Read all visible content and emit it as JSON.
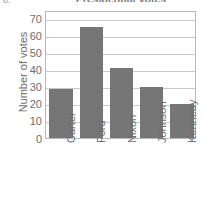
{
  "item_marker": "8.",
  "chart_data": {
    "type": "bar",
    "title": "Presidential Votes",
    "xlabel": "",
    "ylabel": "Number of votes",
    "categories": [
      "Carter",
      "Ford",
      "Nixon",
      "Johnson",
      "Kennedy"
    ],
    "values": [
      29,
      65,
      41,
      30,
      20
    ],
    "yticks": [
      0,
      10,
      20,
      30,
      40,
      50,
      60,
      70
    ],
    "ylim": [
      0,
      75
    ],
    "grid": true,
    "legend": "none",
    "bar_color": "#767676",
    "frame_color": "#b9b9b9",
    "gridline_color": "#c9c9c9",
    "text_color": "#6e6e6e"
  }
}
